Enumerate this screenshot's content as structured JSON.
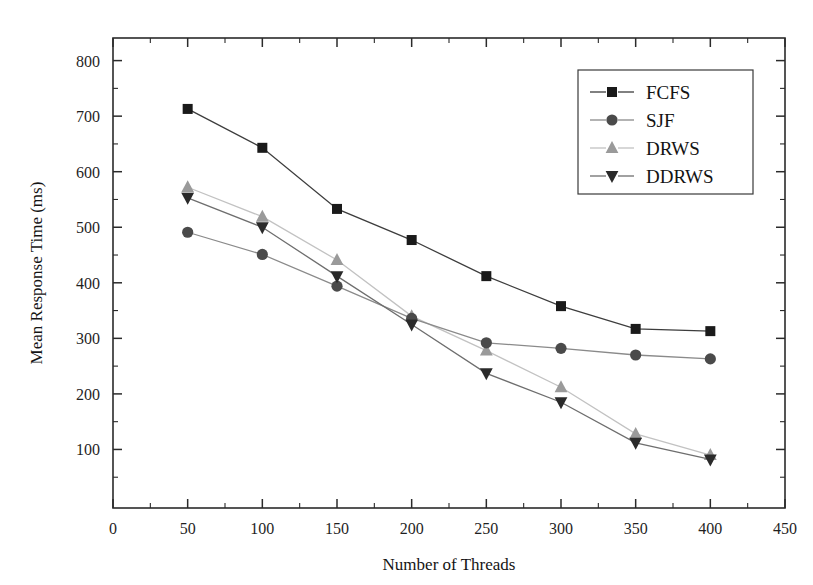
{
  "chart_data": {
    "type": "line",
    "title": "",
    "xlabel": "Number of Threads",
    "ylabel": "Mean Response Time (ms)",
    "xlim": [
      0,
      450
    ],
    "ylim": [
      0,
      850
    ],
    "x": [
      50,
      100,
      150,
      200,
      250,
      300,
      350,
      400
    ],
    "xticks": [
      0,
      50,
      100,
      150,
      200,
      250,
      300,
      350,
      400,
      450
    ],
    "xtick_labels": [
      "0",
      "50",
      "100",
      "150",
      "200",
      "250",
      "300",
      "350",
      "400",
      "450"
    ],
    "yticks": [
      100,
      200,
      300,
      400,
      500,
      600,
      700,
      800
    ],
    "ytick_labels": [
      "100",
      "200",
      "300",
      "400",
      "500",
      "600",
      "700",
      "800"
    ],
    "minor_tick_step_x": 25,
    "minor_tick_step_y": 50,
    "grid": false,
    "legend_position": "top-right",
    "series": [
      {
        "name": "FCFS",
        "marker": "square",
        "color": "#1a1a1a",
        "line_color": "#3d3d3d",
        "values": [
          713,
          643,
          533,
          477,
          412,
          358,
          317,
          313
        ]
      },
      {
        "name": "SJF",
        "marker": "circle",
        "color": "#4a4a4a",
        "line_color": "#8a8a8a",
        "values": [
          491,
          451,
          394,
          336,
          292,
          282,
          270,
          263
        ]
      },
      {
        "name": "DRWS",
        "marker": "triangle-up",
        "color": "#9a9a9a",
        "line_color": "#c2c2c2",
        "values": [
          572,
          519,
          441,
          340,
          278,
          212,
          128,
          90
        ]
      },
      {
        "name": "DDRWS",
        "marker": "triangle-down",
        "color": "#2a2a2a",
        "line_color": "#6e6e6e",
        "values": [
          553,
          500,
          412,
          325,
          237,
          185,
          112,
          82
        ]
      }
    ]
  },
  "legend": {
    "entries": [
      "FCFS",
      "SJF",
      "DRWS",
      "DDRWS"
    ]
  }
}
